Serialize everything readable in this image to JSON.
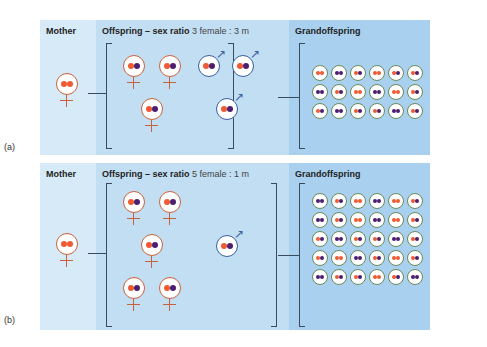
{
  "panels": [
    {
      "label": "(a)",
      "mother_header": "Mother",
      "offspring_header": "Offspring – sex ratio",
      "offspring_ratio": "3 female : 3 male",
      "grand_header": "Grandoffspring",
      "mother": {
        "sex": "female",
        "alleles": [
          "orange",
          "orange"
        ]
      },
      "offspring": [
        {
          "sex": "female",
          "alleles": [
            "orange",
            "purple"
          ]
        },
        {
          "sex": "female",
          "alleles": [
            "orange",
            "purple"
          ]
        },
        {
          "sex": "female",
          "alleles": [
            "orange",
            "purple"
          ]
        },
        {
          "sex": "male",
          "alleles": [
            "orange",
            "purple"
          ]
        },
        {
          "sex": "male",
          "alleles": [
            "orange",
            "purple"
          ]
        },
        {
          "sex": "male",
          "alleles": [
            "orange",
            "purple"
          ]
        }
      ],
      "grandoffspring_rows": [
        [
          "oo",
          "pp",
          "op",
          "oo",
          "op",
          "op"
        ],
        [
          "pp",
          "op",
          "oo",
          "pp",
          "oo",
          "op"
        ],
        [
          "op",
          "pp",
          "op",
          "op",
          "pp",
          "op"
        ]
      ]
    },
    {
      "label": "(b)",
      "mother_header": "Mother",
      "offspring_header": "Offspring – sex ratio",
      "offspring_ratio": "5 female : 1 male",
      "grand_header": "Grandoffspring",
      "mother": {
        "sex": "female",
        "alleles": [
          "orange",
          "orange"
        ]
      },
      "offspring": [
        {
          "sex": "female",
          "alleles": [
            "orange",
            "purple"
          ]
        },
        {
          "sex": "female",
          "alleles": [
            "orange",
            "purple"
          ]
        },
        {
          "sex": "female",
          "alleles": [
            "orange",
            "purple"
          ]
        },
        {
          "sex": "female",
          "alleles": [
            "orange",
            "purple"
          ]
        },
        {
          "sex": "female",
          "alleles": [
            "orange",
            "purple"
          ]
        },
        {
          "sex": "male",
          "alleles": [
            "orange",
            "purple"
          ]
        }
      ],
      "grandoffspring_rows": [
        [
          "pp",
          "op",
          "oo",
          "pp",
          "oo",
          "op"
        ],
        [
          "pp",
          "op",
          "oo",
          "pp",
          "oo",
          "op"
        ],
        [
          "op",
          "pp",
          "op",
          "op",
          "pp",
          "op"
        ],
        [
          "op",
          "oo",
          "pp",
          "op",
          "oo",
          "op"
        ],
        [
          "pp",
          "op",
          "op",
          "oo",
          "op",
          "pp"
        ]
      ]
    }
  ],
  "colors": {
    "orange": "#ef5a32",
    "purple": "#4b1e6e",
    "female_symbol": "#c8623d",
    "male_symbol": "#3a5fa0"
  }
}
